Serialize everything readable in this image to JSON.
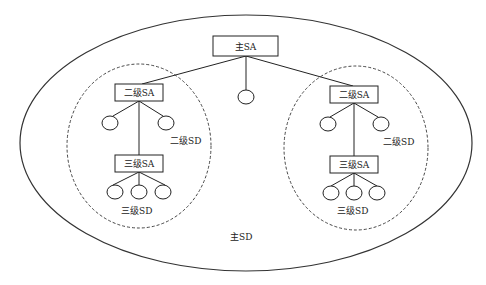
{
  "diagram": {
    "type": "hierarchical-domain-diagram",
    "colors": {
      "stroke": "#222222",
      "background": "#ffffff"
    },
    "main_domain": {
      "label": "主SD"
    },
    "main_agent": {
      "label": "主SA"
    },
    "left_domain": {
      "label_level2_domain": "二级SD",
      "level2_agent": "二级SA",
      "level3_agent": "三级SA",
      "label_level3_domain": "三级SD"
    },
    "right_domain": {
      "label_level2_domain": "二级SD",
      "level2_agent": "二级SA",
      "level3_agent": "三级SA",
      "label_level3_domain": "三级SD"
    }
  }
}
